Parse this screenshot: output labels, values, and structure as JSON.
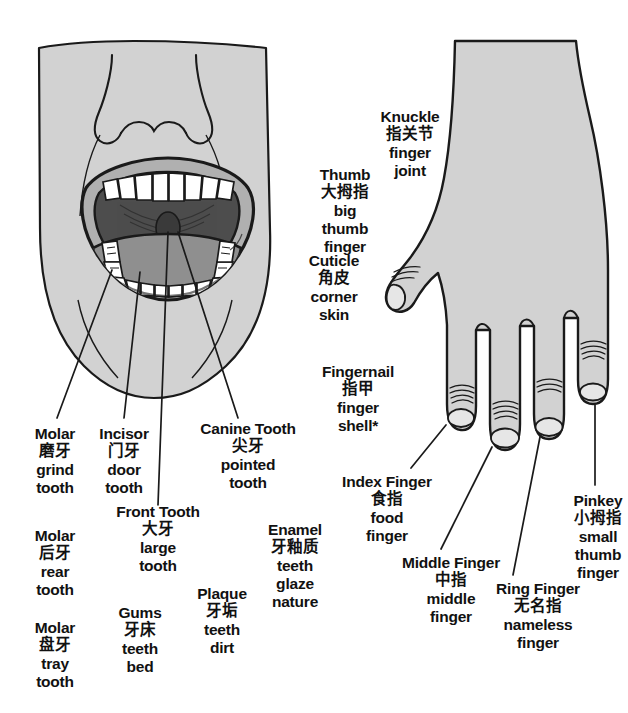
{
  "page": {
    "background_color": "#ffffff",
    "text_color": "#111111",
    "skin_fill": "#d2d2d2",
    "lip_fill": "#b0b0b0",
    "mouth_dark_fill": "#4d4d4d",
    "tongue_fill": "#8f8f8f",
    "tooth_fill": "#ffffff",
    "outline_color": "#1a1a1a"
  },
  "labels": {
    "molar_grind": {
      "en": "Molar",
      "zh": "磨牙",
      "lit_1": "grind",
      "lit_2": "tooth"
    },
    "incisor": {
      "en": "Incisor",
      "zh": "门牙",
      "lit_1": "door",
      "lit_2": "tooth"
    },
    "canine": {
      "en": "Canine Tooth",
      "zh": "尖牙",
      "lit_1": "pointed",
      "lit_2": "tooth"
    },
    "front_tooth": {
      "en": "Front Tooth",
      "zh": "大牙",
      "lit_1": "large",
      "lit_2": "tooth"
    },
    "molar_rear": {
      "en": "Molar",
      "zh": "后牙",
      "lit_1": "rear",
      "lit_2": "tooth"
    },
    "molar_tray": {
      "en": "Molar",
      "zh": "盘牙",
      "lit_1": "tray",
      "lit_2": "tooth"
    },
    "gums": {
      "en": "Gums",
      "zh": "牙床",
      "lit_1": "teeth",
      "lit_2": "bed"
    },
    "plaque": {
      "en": "Plaque",
      "zh": "牙垢",
      "lit_1": "teeth",
      "lit_2": "dirt"
    },
    "enamel": {
      "en": "Enamel",
      "zh": "牙釉质",
      "lit_1": "teeth",
      "lit_2": "glaze",
      "lit_3": "nature"
    },
    "knuckle": {
      "en": "Knuckle",
      "zh": "指关节",
      "lit_1": "finger",
      "lit_2": "joint"
    },
    "thumb": {
      "en": "Thumb",
      "zh": "大拇指",
      "lit_1": "big",
      "lit_2": "thumb",
      "lit_3": "finger"
    },
    "cuticle": {
      "en": "Cuticle",
      "zh": "角皮",
      "lit_1": "corner",
      "lit_2": "skin"
    },
    "fingernail": {
      "en": "Fingernail",
      "zh": "指甲",
      "lit_1": "finger",
      "lit_2": "shell*"
    },
    "index_finger": {
      "en": "Index Finger",
      "zh": "食指",
      "lit_1": "food",
      "lit_2": "finger"
    },
    "middle_finger": {
      "en": "Middle Finger",
      "zh": "中指",
      "lit_1": "middle",
      "lit_2": "finger"
    },
    "ring_finger": {
      "en": "Ring Finger",
      "zh": "无名指",
      "lit_1": "nameless",
      "lit_2": "finger"
    },
    "pinkey": {
      "en": "Pinkey",
      "zh": "小拇指",
      "lit_1": "small",
      "lit_2": "thumb",
      "lit_3": "finger"
    }
  }
}
